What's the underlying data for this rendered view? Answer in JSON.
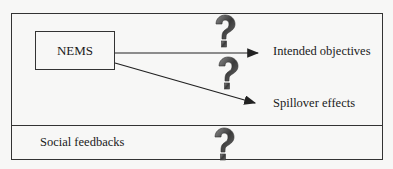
{
  "diagram": {
    "source_node": "NEMS",
    "targets": [
      {
        "label": "Intended objectives",
        "uncertain": true
      },
      {
        "label": "Spillover effects",
        "uncertain": true
      }
    ],
    "bottom_section": {
      "label": "Social feedbacks",
      "uncertain": true
    },
    "icon": "question-mark-icon",
    "colors": {
      "line": "#333333",
      "question_mark": "#4a4a4a"
    }
  }
}
